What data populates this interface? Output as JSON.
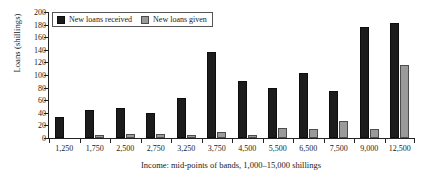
{
  "chart_data": {
    "type": "bar",
    "title": "",
    "xlabel": "Income: mid-points of bands, 1,000–15,000 shillings",
    "ylabel": "Loans (shillings)",
    "categories": [
      "1,250",
      "1,750",
      "2,500",
      "2,750",
      "3,250",
      "3,750",
      "4,500",
      "5,500",
      "6,500",
      "7,500",
      "9,000",
      "12,500"
    ],
    "series": [
      {
        "name": "New loans received",
        "color": "#1c1c1c",
        "values": [
          34,
          44,
          48,
          39,
          63,
          136,
          90,
          79,
          103,
          75,
          176,
          182
        ]
      },
      {
        "name": "New loans given",
        "color": "#9a9a9a",
        "values": [
          0,
          5,
          6,
          7,
          4,
          10,
          4,
          16,
          14,
          27,
          14,
          116
        ]
      }
    ],
    "ylim": [
      0,
      200
    ],
    "yticks": [
      0,
      20,
      40,
      60,
      80,
      100,
      120,
      140,
      160,
      180,
      200
    ],
    "ytick_labels": [
      "0",
      "20",
      "40",
      "60",
      "80",
      "100",
      "120",
      "140",
      "160",
      "180",
      "200"
    ],
    "grid": false,
    "legend_position": "top-left"
  }
}
